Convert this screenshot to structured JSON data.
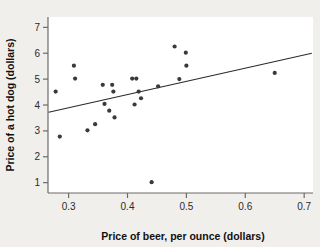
{
  "chart_data": {
    "type": "scatter",
    "title": "",
    "xlabel": "Price of beer, per ounce (dollars)",
    "ylabel": "Price of a hot dog (dollars)",
    "xlim": [
      0.265,
      0.715
    ],
    "ylim": [
      0.6,
      7.4
    ],
    "xticks": [
      0.3,
      0.4,
      0.5,
      0.6,
      0.7
    ],
    "xtick_labels": [
      "0.3",
      "0.4",
      "0.5",
      "0.6",
      "0.7"
    ],
    "yticks": [
      1,
      2,
      3,
      4,
      5,
      6,
      7
    ],
    "ytick_labels": [
      "1",
      "2",
      "3",
      "4",
      "5",
      "6",
      "7"
    ],
    "grid": false,
    "legend": null,
    "point_color": "#3a3a3a",
    "line_color": "#2b2b2b",
    "plot_background": "#ffffff",
    "figure_background": "#f1efec",
    "axis_color": "#6d6a68",
    "points": [
      {
        "x": 0.278,
        "y": 4.52
      },
      {
        "x": 0.285,
        "y": 2.78
      },
      {
        "x": 0.309,
        "y": 5.52
      },
      {
        "x": 0.311,
        "y": 5.02
      },
      {
        "x": 0.332,
        "y": 3.02
      },
      {
        "x": 0.345,
        "y": 3.26
      },
      {
        "x": 0.358,
        "y": 4.78
      },
      {
        "x": 0.361,
        "y": 4.04
      },
      {
        "x": 0.369,
        "y": 3.78
      },
      {
        "x": 0.374,
        "y": 4.78
      },
      {
        "x": 0.376,
        "y": 4.52
      },
      {
        "x": 0.378,
        "y": 3.52
      },
      {
        "x": 0.408,
        "y": 5.02
      },
      {
        "x": 0.412,
        "y": 4.02
      },
      {
        "x": 0.415,
        "y": 5.02
      },
      {
        "x": 0.419,
        "y": 4.52
      },
      {
        "x": 0.423,
        "y": 4.26
      },
      {
        "x": 0.441,
        "y": 1.02
      },
      {
        "x": 0.452,
        "y": 4.72
      },
      {
        "x": 0.48,
        "y": 6.26
      },
      {
        "x": 0.488,
        "y": 5.0
      },
      {
        "x": 0.499,
        "y": 6.02
      },
      {
        "x": 0.5,
        "y": 5.52
      },
      {
        "x": 0.65,
        "y": 5.24
      }
    ],
    "trend_line": {
      "type": "linear-fit",
      "x_start": 0.266,
      "y_start": 3.72,
      "x_end": 0.713,
      "y_end": 6.0
    }
  }
}
